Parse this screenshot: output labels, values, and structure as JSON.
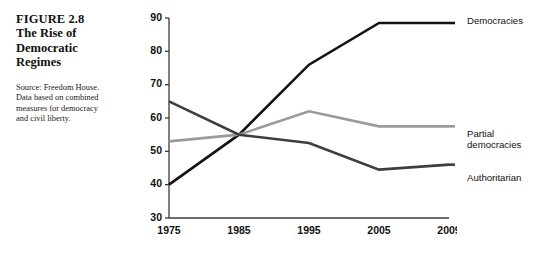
{
  "caption": {
    "figure_number": "FIGURE 2.8",
    "title": "The Rise of Democratic Regimes",
    "source": "Source: Freedom House. Data based on combined measures for democracy and civil liberty."
  },
  "chart_data": {
    "type": "line",
    "title": "The Rise of Democratic Regimes",
    "xlabel": "",
    "ylabel": "",
    "x": [
      "1975",
      "1985",
      "1995",
      "2005",
      "2009"
    ],
    "categories": [
      "1975",
      "1985",
      "1995",
      "2005",
      "2009"
    ],
    "ylim": [
      30,
      90
    ],
    "yticks": [
      30,
      40,
      50,
      60,
      70,
      80,
      90
    ],
    "ytick_labels": [
      "30",
      "40",
      "50",
      "60",
      "70",
      "80",
      "90"
    ],
    "xtick_labels": [
      "1975",
      "1985",
      "1995",
      "2005",
      "2009"
    ],
    "grid": false,
    "legend_position": "right-inline",
    "series": [
      {
        "name": "Democracies",
        "color": "#141414",
        "width": 2.6,
        "values": [
          40,
          55,
          76,
          88.5,
          88.5
        ]
      },
      {
        "name": "Partial democracies",
        "color": "#9a9a9a",
        "width": 2.6,
        "values": [
          53,
          55,
          62,
          57.5,
          57.5
        ]
      },
      {
        "name": "Authoritarian",
        "color": "#3d3d3d",
        "width": 2.6,
        "values": [
          65,
          55,
          52.5,
          44.5,
          46
        ]
      }
    ]
  },
  "labels": {
    "democracies": "Democracies",
    "partial_line1": "Partial",
    "partial_line2": "democracies",
    "authoritarian": "Authoritarian"
  },
  "colors": {
    "democracies": "#141414",
    "partial": "#9a9a9a",
    "authoritarian": "#3d3d3d",
    "axis": "#3a3a3a",
    "text": "#111111",
    "background": "#ffffff"
  }
}
